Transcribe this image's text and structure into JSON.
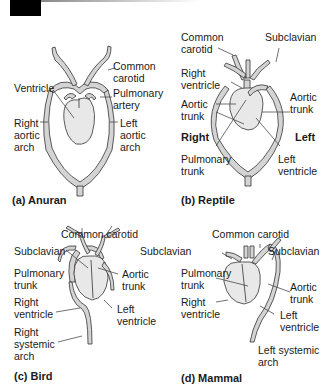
{
  "panels": {
    "a": {
      "caption": "(a) Anuran",
      "labels": {
        "common_carotid": "Common\ncarotid",
        "ventricle": "Ventricle",
        "pulmonary_artery": "Pulmonary\nartery",
        "right_aortic_arch": "Right\naortic\narch",
        "left_aortic_arch": "Left\naortic\narch"
      }
    },
    "b": {
      "caption": "(b) Reptile",
      "labels": {
        "common_carotid": "Common\ncarotid",
        "subclavian": "Subclavian",
        "right_ventricle": "Right\nventricle",
        "aortic_trunk_left": "Aortic\ntrunk",
        "aortic_trunk_right": "Aortic\ntrunk",
        "pulmonary_trunk": "Pulmonary\ntrunk",
        "left_ventricle": "Left\nventricle"
      },
      "side_right": "Right",
      "side_left": "Left"
    },
    "c": {
      "caption": "(c) Bird",
      "labels": {
        "common_carotid": "Common carotid",
        "subclavian_left": "Subclavian",
        "subclavian_right": "Subclavian",
        "pulmonary_trunk": "Pulmonary\ntrunk",
        "aortic_trunk": "Aortic\ntrunk",
        "right_ventricle": "Right\nventricle",
        "left_ventricle": "Left\nventricle",
        "right_systemic_arch": "Right\nsystemic\narch"
      }
    },
    "d": {
      "caption": "(d) Mammal",
      "labels": {
        "common_carotid": "Common carotid",
        "subclavian": "Subclavian",
        "pulmonary_trunk": "Pulmonary\ntrunk",
        "aortic_trunk": "Aortic\ntrunk",
        "right_ventricle": "Right\nventricle",
        "left_ventricle": "Left\nventricle",
        "left_systemic_arch": "Left systemic\narch"
      }
    }
  },
  "colors": {
    "vessel": "#cfcfcf",
    "heart": "#e6e6e6",
    "stroke": "#333333"
  }
}
